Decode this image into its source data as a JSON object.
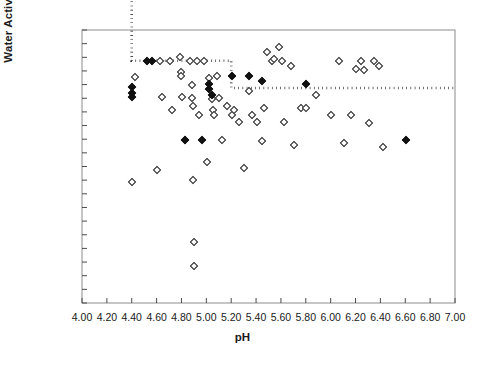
{
  "chart_data": {
    "type": "scatter",
    "title": "",
    "xlabel": "pH",
    "ylabel": "Water Activity",
    "xlim": [
      4.0,
      7.0
    ],
    "ylim": [
      0.6,
      1.0
    ],
    "xticks": [
      "4.00",
      "4.20",
      "4.40",
      "4.60",
      "4.80",
      "5.00",
      "5.20",
      "5.40",
      "5.60",
      "5.80",
      "6.00",
      "6.20",
      "6.40",
      "6.60",
      "6.80",
      "7.00"
    ],
    "xtick_values": [
      4.0,
      4.2,
      4.4,
      4.6,
      4.8,
      5.0,
      5.2,
      5.4,
      5.6,
      5.8,
      6.0,
      6.2,
      6.4,
      6.6,
      6.8,
      7.0
    ],
    "yticks": [
      "1.00",
      "0.98",
      "0.96",
      "0.94",
      "0.92",
      "0.90",
      "0.88",
      "0.86",
      "0.84",
      "0.82",
      "0.80",
      "0.78",
      "0.76",
      "0.74",
      "0.72",
      "0.70",
      "0.68",
      "0.66",
      "0.64",
      "0.62",
      "0.60"
    ],
    "ytick_values": [
      1.0,
      0.98,
      0.96,
      0.94,
      0.92,
      0.9,
      0.88,
      0.86,
      0.84,
      0.82,
      0.8,
      0.78,
      0.76,
      0.74,
      0.72,
      0.7,
      0.68,
      0.66,
      0.64,
      0.62,
      0.6
    ],
    "grid": false,
    "legend": null,
    "series": [
      {
        "name": "open-diamond",
        "marker": "open diamond",
        "color": "#222222",
        "points": [
          [
            4.4,
            0.778
          ],
          [
            4.42,
            0.932
          ],
          [
            4.6,
            0.796
          ],
          [
            4.62,
            0.955
          ],
          [
            4.64,
            0.902
          ],
          [
            4.7,
            0.955
          ],
          [
            4.72,
            0.883
          ],
          [
            4.78,
            0.962
          ],
          [
            4.79,
            0.94
          ],
          [
            4.79,
            0.934
          ],
          [
            4.8,
            0.902
          ],
          [
            4.82,
            0.84
          ],
          [
            4.86,
            0.955
          ],
          [
            4.88,
            0.92
          ],
          [
            4.88,
            0.901
          ],
          [
            4.89,
            0.89
          ],
          [
            4.89,
            0.781
          ],
          [
            4.9,
            0.69
          ],
          [
            4.9,
            0.655
          ],
          [
            4.92,
            0.955
          ],
          [
            4.94,
            0.876
          ],
          [
            4.98,
            0.955
          ],
          [
            5.0,
            0.808
          ],
          [
            5.02,
            0.93
          ],
          [
            5.04,
            0.9
          ],
          [
            5.05,
            0.884
          ],
          [
            5.06,
            0.876
          ],
          [
            5.08,
            0.934
          ],
          [
            5.1,
            0.901
          ],
          [
            5.12,
            0.84
          ],
          [
            5.16,
            0.89
          ],
          [
            5.2,
            0.876
          ],
          [
            5.22,
            0.884
          ],
          [
            5.26,
            0.866
          ],
          [
            5.3,
            0.798
          ],
          [
            5.34,
            0.912
          ],
          [
            5.36,
            0.876
          ],
          [
            5.4,
            0.866
          ],
          [
            5.44,
            0.838
          ],
          [
            5.46,
            0.886
          ],
          [
            5.48,
            0.968
          ],
          [
            5.52,
            0.955
          ],
          [
            5.54,
            0.958
          ],
          [
            5.58,
            0.976
          ],
          [
            5.6,
            0.955
          ],
          [
            5.62,
            0.866
          ],
          [
            5.68,
            0.948
          ],
          [
            5.7,
            0.832
          ],
          [
            5.76,
            0.886
          ],
          [
            5.8,
            0.886
          ],
          [
            5.88,
            0.906
          ],
          [
            6.0,
            0.876
          ],
          [
            6.06,
            0.955
          ],
          [
            6.1,
            0.836
          ],
          [
            6.16,
            0.876
          ],
          [
            6.2,
            0.944
          ],
          [
            6.24,
            0.955
          ],
          [
            6.26,
            0.942
          ],
          [
            6.3,
            0.865
          ],
          [
            6.34,
            0.955
          ],
          [
            6.38,
            0.948
          ],
          [
            6.42,
            0.83
          ]
        ]
      },
      {
        "name": "filled-diamond",
        "marker": "filled diamond",
        "color": "#111111",
        "points": [
          [
            4.4,
            0.918
          ],
          [
            4.4,
            0.908
          ],
          [
            4.4,
            0.902
          ],
          [
            4.52,
            0.955
          ],
          [
            4.56,
            0.955
          ],
          [
            4.82,
            0.84
          ],
          [
            4.96,
            0.84
          ],
          [
            5.02,
            0.922
          ],
          [
            5.02,
            0.915
          ],
          [
            5.04,
            0.905
          ],
          [
            5.2,
            0.934
          ],
          [
            5.34,
            0.934
          ],
          [
            5.44,
            0.926
          ],
          [
            5.8,
            0.922
          ],
          [
            6.6,
            0.84
          ]
        ]
      }
    ],
    "boundary": {
      "name": "growth-boundary",
      "style": "dotted",
      "color": "#111111",
      "vertices": [
        [
          4.4,
          1.048
        ],
        [
          4.4,
          0.955
        ],
        [
          5.2,
          0.955
        ],
        [
          5.2,
          0.915
        ],
        [
          7.0,
          0.915
        ]
      ]
    }
  }
}
